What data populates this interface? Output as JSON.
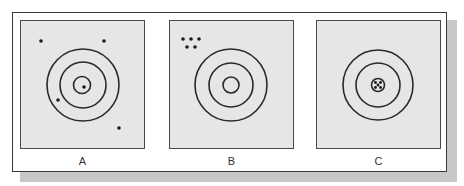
{
  "figure": {
    "panels": [
      {
        "label": "A",
        "description": "targets scattered, not clustered (low accuracy, low precision)"
      },
      {
        "label": "B",
        "description": "hits tightly clustered but away from center (high precision, low accuracy)"
      },
      {
        "label": "C",
        "description": "hits tightly clustered in the bullseye (high precision, high accuracy)"
      }
    ]
  },
  "colors": {
    "panel_fill": "#e6e6e6",
    "ring_stroke": "#2a2a2a",
    "dot_fill": "#1a1a1a",
    "shadow": "#c8c8c8"
  }
}
